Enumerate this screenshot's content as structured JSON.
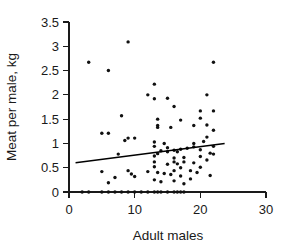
{
  "chart_data": {
    "type": "scatter",
    "title": "",
    "xlabel": "Adult males",
    "ylabel": "Meat per male, kg",
    "xlim": [
      0,
      30
    ],
    "ylim": [
      0,
      3.5
    ],
    "grid": false,
    "legend": null,
    "xticks": [
      0,
      10,
      20,
      30
    ],
    "xtick_labels": [
      "0",
      "10",
      "20",
      "30"
    ],
    "yticks": [
      0,
      0.5,
      1,
      1.5,
      2,
      2.5,
      3,
      3.5
    ],
    "ytick_labels": [
      "0",
      "0.5",
      "1",
      "1.5",
      "2",
      "2.5",
      "3",
      "3.5"
    ],
    "points": [
      [
        3.0,
        2.67
      ],
      [
        6.0,
        2.5
      ],
      [
        9.0,
        3.09
      ],
      [
        22.0,
        2.67
      ],
      [
        13.0,
        2.22
      ],
      [
        12.0,
        2.0
      ],
      [
        13.0,
        1.92
      ],
      [
        15.0,
        1.93
      ],
      [
        21.0,
        2.0
      ],
      [
        16.0,
        1.76
      ],
      [
        8.0,
        1.57
      ],
      [
        20.0,
        1.67
      ],
      [
        22.0,
        1.67
      ],
      [
        17.0,
        1.48
      ],
      [
        13.5,
        1.5
      ],
      [
        20.0,
        1.52
      ],
      [
        13.5,
        1.37
      ],
      [
        13.5,
        1.33
      ],
      [
        15.5,
        1.33
      ],
      [
        19.0,
        1.37
      ],
      [
        21.0,
        1.38
      ],
      [
        22.0,
        1.27
      ],
      [
        5.0,
        1.21
      ],
      [
        6.0,
        1.21
      ],
      [
        9.0,
        1.11
      ],
      [
        10.0,
        1.11
      ],
      [
        8.5,
        1.06
      ],
      [
        21.0,
        1.13
      ],
      [
        13.0,
        1.03
      ],
      [
        14.5,
        1.0
      ],
      [
        19.0,
        1.0
      ],
      [
        20.5,
        1.04
      ],
      [
        22.0,
        0.94
      ],
      [
        13.0,
        0.94
      ],
      [
        15.0,
        0.91
      ],
      [
        16.0,
        0.86
      ],
      [
        17.0,
        0.88
      ],
      [
        18.0,
        0.9
      ],
      [
        19.0,
        0.93
      ],
      [
        20.0,
        0.87
      ],
      [
        14.0,
        0.85
      ],
      [
        15.0,
        0.83
      ],
      [
        16.5,
        0.83
      ],
      [
        21.5,
        0.8
      ],
      [
        22.0,
        0.78
      ],
      [
        13.5,
        0.79
      ],
      [
        7.5,
        0.78
      ],
      [
        13.0,
        0.74
      ],
      [
        16.0,
        0.7
      ],
      [
        17.5,
        0.71
      ],
      [
        20.0,
        0.73
      ],
      [
        21.0,
        0.66
      ],
      [
        13.0,
        0.62
      ],
      [
        16.0,
        0.62
      ],
      [
        16.5,
        0.58
      ],
      [
        17.5,
        0.62
      ],
      [
        19.0,
        0.6
      ],
      [
        15.0,
        0.57
      ],
      [
        13.0,
        0.52
      ],
      [
        17.0,
        0.5
      ],
      [
        20.0,
        0.51
      ],
      [
        21.5,
        0.34
      ],
      [
        5.0,
        0.42
      ],
      [
        9.0,
        0.44
      ],
      [
        9.5,
        0.37
      ],
      [
        10.0,
        0.32
      ],
      [
        12.0,
        0.42
      ],
      [
        13.5,
        0.4
      ],
      [
        14.5,
        0.38
      ],
      [
        15.5,
        0.36
      ],
      [
        16.0,
        0.44
      ],
      [
        17.0,
        0.33
      ],
      [
        18.5,
        0.44
      ],
      [
        19.5,
        0.4
      ],
      [
        6.0,
        0.19
      ],
      [
        7.0,
        0.3
      ],
      [
        13.0,
        0.25
      ],
      [
        14.0,
        0.21
      ],
      [
        16.0,
        0.23
      ],
      [
        17.5,
        0.17
      ],
      [
        18.5,
        0.27
      ],
      [
        2.0,
        0.0
      ],
      [
        3.0,
        0.0
      ],
      [
        5.0,
        0.0
      ],
      [
        6.0,
        0.0
      ],
      [
        7.0,
        0.0
      ],
      [
        8.0,
        0.0
      ],
      [
        9.0,
        0.0
      ],
      [
        10.0,
        0.0
      ],
      [
        11.0,
        0.0
      ],
      [
        12.0,
        0.0
      ],
      [
        13.0,
        0.0
      ],
      [
        13.5,
        0.0
      ],
      [
        14.0,
        0.0
      ],
      [
        15.0,
        0.0
      ],
      [
        16.0,
        0.0
      ],
      [
        16.5,
        0.0
      ],
      [
        17.0,
        0.0
      ],
      [
        17.5,
        0.0
      ]
    ],
    "trend_line": {
      "x0": 1.0,
      "y0": 0.6,
      "x1": 23.7,
      "y1": 1.0
    }
  }
}
